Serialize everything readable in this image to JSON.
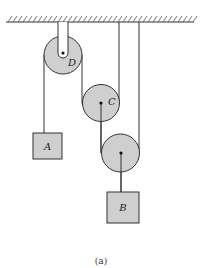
{
  "figure": {
    "caption": "(a)",
    "colors": {
      "pulley_fill": "#cfcfcf",
      "block_fill": "#cfcfcf",
      "line": "#333333"
    },
    "pulleys": [
      {
        "id": "D",
        "label": "D"
      },
      {
        "id": "C",
        "label": "C"
      },
      {
        "id": "lower",
        "label": ""
      }
    ],
    "blocks": [
      {
        "id": "A",
        "label": "A"
      },
      {
        "id": "B",
        "label": "B"
      }
    ]
  }
}
